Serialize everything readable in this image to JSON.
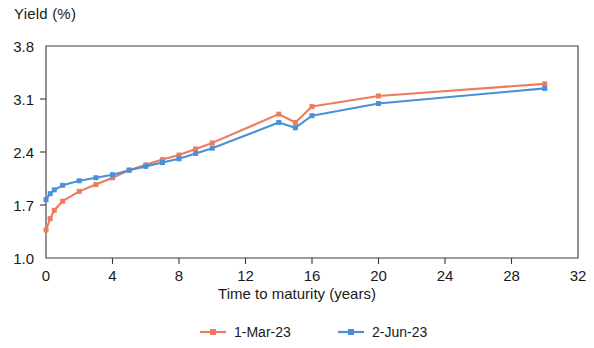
{
  "chart_data": {
    "type": "line",
    "title": "",
    "ylabel": "Yield (%)",
    "xlabel": "Time to maturity (years)",
    "xlim": [
      0,
      32
    ],
    "ylim": [
      1.0,
      3.8
    ],
    "xticks": [
      0,
      4,
      8,
      12,
      16,
      20,
      24,
      28,
      32
    ],
    "xtick_labels": [
      "0",
      "4",
      "8",
      "12",
      "16",
      "20",
      "24",
      "28",
      "32"
    ],
    "yticks": [
      1.0,
      1.7,
      2.4,
      3.1,
      3.8
    ],
    "ytick_labels": [
      "1.0",
      "1.7",
      "2.4",
      "3.1",
      "3.8"
    ],
    "grid": false,
    "legend_position": "bottom",
    "series": [
      {
        "name": "1-Mar-23",
        "color": "#EE7B5E",
        "marker": "square",
        "x": [
          0,
          0.25,
          0.5,
          1,
          2,
          3,
          4,
          5,
          6,
          7,
          8,
          9,
          10,
          14,
          15,
          16,
          20,
          30
        ],
        "y": [
          1.37,
          1.52,
          1.63,
          1.75,
          1.88,
          1.97,
          2.06,
          2.16,
          2.23,
          2.3,
          2.36,
          2.44,
          2.52,
          2.9,
          2.79,
          3.0,
          3.14,
          3.3
        ]
      },
      {
        "name": "2-Jun-23",
        "color": "#4A90D9",
        "marker": "square",
        "x": [
          0,
          0.25,
          0.5,
          1,
          2,
          3,
          4,
          5,
          6,
          7,
          8,
          9,
          10,
          14,
          15,
          16,
          20,
          30
        ],
        "y": [
          1.77,
          1.85,
          1.9,
          1.96,
          2.02,
          2.06,
          2.1,
          2.16,
          2.21,
          2.26,
          2.31,
          2.38,
          2.45,
          2.79,
          2.72,
          2.88,
          3.04,
          3.24
        ]
      }
    ]
  },
  "legend": {
    "items": [
      {
        "label": "1-Mar-23",
        "color": "#EE7B5E"
      },
      {
        "label": "2-Jun-23",
        "color": "#4A90D9"
      }
    ]
  }
}
